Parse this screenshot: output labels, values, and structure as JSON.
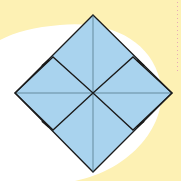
{
  "diagram": {
    "colors": {
      "background": "#ffffff",
      "highlight": "#fdf1b4",
      "paper": "#a9d3ee",
      "stroke": "#1a1a1a",
      "crease": "#3a5a6a",
      "marks": "#e7a8b8"
    },
    "shapes": {
      "outer_diamond": "diamond",
      "inner_flaps": [
        "left-flap",
        "right-flap"
      ],
      "creases": [
        "vertical",
        "horizontal"
      ]
    }
  }
}
